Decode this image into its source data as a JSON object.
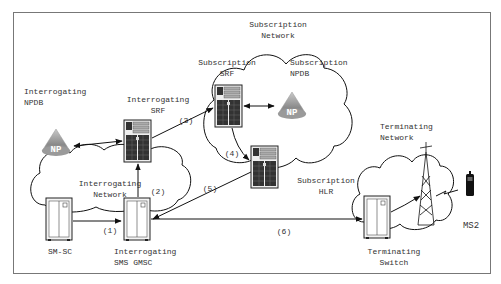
{
  "diagram": {
    "frame": {
      "border_color": "#777777"
    },
    "networks": {
      "interrogating": {
        "label": "Interrogating\nNetwork"
      },
      "subscription": {
        "label": "Subscription\nNetwork"
      },
      "terminating": {
        "label": "Terminating\nNetwork"
      }
    },
    "nodes": {
      "interrogating_npdb": {
        "label": "Interrogating\nNPDB",
        "badge": "NP"
      },
      "interrogating_srf": {
        "label": "Interrogating\nSRF"
      },
      "subscription_srf": {
        "label": "Subscription\nSRF"
      },
      "subscription_npdb": {
        "label": "Subscription\nNPDB",
        "badge": "NP"
      },
      "subscription_hlr": {
        "label": "Subscription\nHLR"
      },
      "sm_sc": {
        "label": "SM-SC"
      },
      "interrogating_gmsc": {
        "label": "Interrogating\nSMS GMSC"
      },
      "terminating_switch": {
        "label": "Terminating\nSwitch"
      },
      "ms2": {
        "label": "MS2"
      }
    },
    "steps": {
      "s1": "(1)",
      "s2": "(2)",
      "s3": "(3)",
      "s4": "(4)",
      "s5": "(5)",
      "s6": "(6)"
    }
  }
}
